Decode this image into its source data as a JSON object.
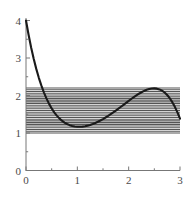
{
  "figure": {
    "title": "",
    "background_color": "#ffffff",
    "curve_color": "#1a1a1a",
    "axis_color": "#777777",
    "hatch_color": "#555555",
    "tick_label_color": "#4a4a4a"
  },
  "chart_data": {
    "type": "line",
    "title": "",
    "xlabel": "",
    "ylabel": "",
    "xlim": [
      0,
      3
    ],
    "ylim": [
      0,
      4
    ],
    "grid": false,
    "legend": null,
    "x_ticks": [
      0,
      1,
      2,
      3
    ],
    "x_tick_labels": [
      "0",
      "1",
      "2",
      "3"
    ],
    "x_minor_ticks": [
      0.5,
      1.5,
      2.5
    ],
    "y_ticks": [
      0,
      1,
      2,
      3,
      4
    ],
    "y_tick_labels": [
      "0",
      "1",
      "2",
      "3",
      "4"
    ],
    "y_minor_ticks": [
      0.5,
      1.5,
      2.5,
      3.5
    ],
    "series": [
      {
        "name": "curve",
        "x": [
          0.0,
          0.05,
          0.1,
          0.15,
          0.2,
          0.25,
          0.3,
          0.35,
          0.4,
          0.45,
          0.5,
          0.55,
          0.6,
          0.65,
          0.7,
          0.75,
          0.8,
          0.85,
          0.9,
          0.95,
          1.0,
          1.05,
          1.1,
          1.15,
          1.2,
          1.25,
          1.3,
          1.35,
          1.4,
          1.45,
          1.5,
          1.55,
          1.6,
          1.65,
          1.7,
          1.75,
          1.8,
          1.85,
          1.9,
          1.95,
          2.0,
          2.05,
          2.1,
          2.15,
          2.2,
          2.25,
          2.3,
          2.35,
          2.4,
          2.45,
          2.5,
          2.55,
          2.6,
          2.65,
          2.7,
          2.75,
          2.8,
          2.85,
          2.9,
          2.95,
          3.0
        ],
        "y": [
          4.0,
          3.62,
          3.28,
          2.978,
          2.71,
          2.472,
          2.262,
          2.078,
          1.917,
          1.777,
          1.656,
          1.552,
          1.464,
          1.39,
          1.329,
          1.279,
          1.24,
          1.21,
          1.188,
          1.174,
          1.167,
          1.166,
          1.171,
          1.181,
          1.196,
          1.216,
          1.24,
          1.268,
          1.299,
          1.334,
          1.372,
          1.413,
          1.456,
          1.502,
          1.549,
          1.598,
          1.648,
          1.7,
          1.752,
          1.804,
          1.856,
          1.907,
          1.956,
          2.003,
          2.047,
          2.087,
          2.122,
          2.151,
          2.173,
          2.186,
          2.19,
          2.183,
          2.163,
          2.129,
          2.08,
          2.013,
          1.928,
          1.823,
          1.697,
          1.55,
          1.382
        ]
      }
    ],
    "annotations": {
      "hatched_band": {
        "description": "horizontal line fill between local minimum and local maximum levels",
        "y_bottom": 1.0,
        "y_top": 2.2,
        "x_left": 0.0,
        "x_right": 3.0,
        "line_count": 26
      },
      "local_minimum": {
        "x": 1.0,
        "y": 1.0
      },
      "local_maximum": {
        "x": 2.35,
        "y": 2.2
      },
      "start_point": {
        "x": 0.0,
        "y": 4.0
      },
      "end_point": {
        "x": 3.0,
        "y": 1.0
      }
    }
  }
}
